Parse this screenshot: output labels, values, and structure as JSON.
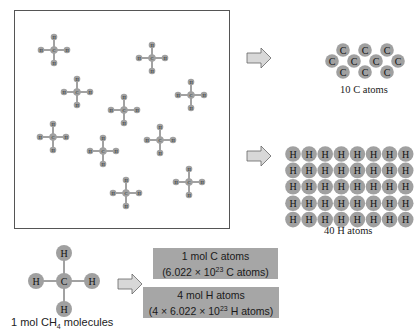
{
  "diagram": {
    "molecule_formula": "CH4",
    "sample_molecule_count": 10,
    "atom_labels": {
      "carbon": "C",
      "hydrogen": "H"
    },
    "colors": {
      "atom_fill": "#a0a0a0",
      "bond": "#444444",
      "box_fill": "#a6a6a6",
      "arrow_fill": "#d8d8d8",
      "frame": "#555555"
    },
    "carbon_group": {
      "count": 10,
      "label": "10 C atoms"
    },
    "hydrogen_group": {
      "count": 40,
      "rows": 5,
      "cols": 8,
      "label": "40 H atoms"
    },
    "bottom": {
      "molecule_label_prefix": "1 mol CH",
      "molecule_label_sub": "4",
      "molecule_label_suffix": " molecules",
      "carbon_box": {
        "line1": "1 mol C atoms",
        "line2_prefix": "(6.022 × 10",
        "line2_exp": "23",
        "line2_suffix": " C atoms)"
      },
      "hydrogen_box": {
        "line1": "4 mol H atoms",
        "line2_prefix": "(4 × 6.022 × 10",
        "line2_exp": "23",
        "line2_suffix": " H atoms)"
      }
    }
  }
}
